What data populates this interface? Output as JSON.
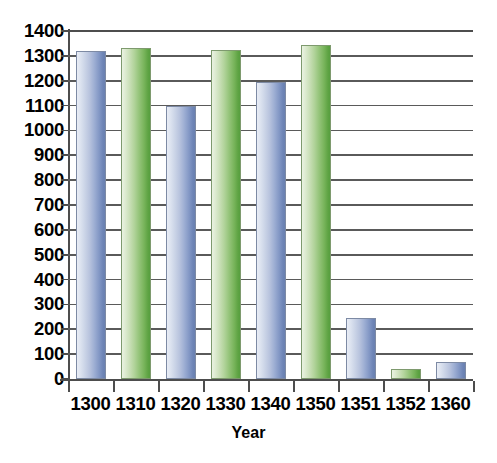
{
  "chart_data": {
    "type": "bar",
    "title": "",
    "subtitle": "",
    "xlabel": "Year",
    "ylabel": "",
    "categories": [
      "1300",
      "1310",
      "1320",
      "1330",
      "1340",
      "1350",
      "1351",
      "1352",
      "1360"
    ],
    "values": [
      1320,
      1330,
      1100,
      1325,
      1195,
      1345,
      245,
      40,
      70
    ],
    "bar_colors": [
      "blue",
      "green",
      "blue",
      "green",
      "blue",
      "green",
      "blue",
      "green",
      "blue"
    ],
    "ylim": [
      0,
      1400
    ],
    "ytick_values": [
      0,
      100,
      200,
      300,
      400,
      500,
      600,
      700,
      800,
      900,
      1000,
      1100,
      1200,
      1300,
      1400
    ],
    "ytick_labels": [
      "0",
      "100",
      "200",
      "300",
      "400",
      "500",
      "600",
      "700",
      "800",
      "900",
      "1000",
      "1100",
      "1200",
      "1300",
      "1400"
    ],
    "grid": true,
    "grid_axis": "y",
    "legend": false,
    "legend_position": "none",
    "annotations": [],
    "series": [
      {
        "name": "Population",
        "values": [
          1320,
          1330,
          1100,
          1325,
          1195,
          1345,
          245,
          40,
          70
        ]
      }
    ],
    "colors": {
      "blue_bar_light": "#e9edf5",
      "blue_bar_dark": "#6a81b2",
      "green_bar_light": "#eaf2e2",
      "green_bar_dark": "#579f3f",
      "gridline": "#5a5a5a",
      "axis": "#4d4d4d",
      "text": "#000000",
      "background": "#ffffff"
    }
  }
}
